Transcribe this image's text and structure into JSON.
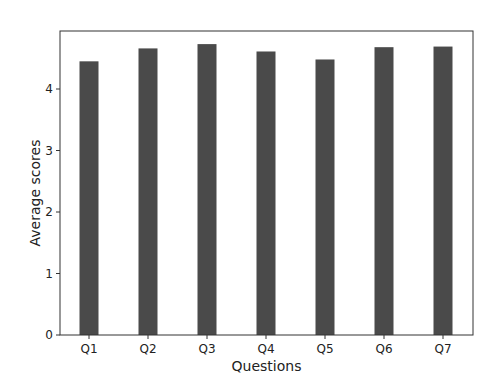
{
  "chart_data": {
    "type": "bar",
    "title": "",
    "xlabel": "Questions",
    "ylabel": "Average scores",
    "categories": [
      "Q1",
      "Q2",
      "Q3",
      "Q4",
      "Q5",
      "Q6",
      "Q7"
    ],
    "values": [
      4.45,
      4.66,
      4.73,
      4.61,
      4.48,
      4.68,
      4.69
    ],
    "ylim": [
      0,
      4.95
    ],
    "yticks": [
      0,
      1,
      2,
      3,
      4
    ],
    "grid": false,
    "legend": null,
    "bar_color": "#4a4a4a"
  }
}
